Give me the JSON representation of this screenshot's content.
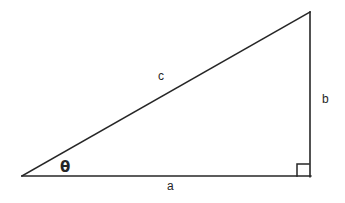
{
  "figure": {
    "background_color": "#ffffff",
    "stroke_color": "#262626",
    "stroke_width": 1.6,
    "width": 345,
    "height": 203,
    "vertices": {
      "left": {
        "x": 22,
        "y": 176,
        "name": "left-vertex"
      },
      "bottom_right": {
        "x": 310,
        "y": 176,
        "name": "right-angle-vertex"
      },
      "apex": {
        "x": 310,
        "y": 12,
        "name": "top-vertex"
      }
    },
    "edges": [
      {
        "name": "base",
        "label": "a",
        "from": "left",
        "to": "bottom_right"
      },
      {
        "name": "vertical",
        "label": "b",
        "from": "bottom_right",
        "to": "apex"
      },
      {
        "name": "hypotenuse",
        "label": "c",
        "from": "left",
        "to": "apex"
      }
    ],
    "right_angle_marker": {
      "name": "right-angle-square",
      "x": 297,
      "y": 164,
      "size": 12
    },
    "labels": {
      "base": "a",
      "vertical": "b",
      "hypotenuse": "c",
      "angle": "θ"
    }
  }
}
